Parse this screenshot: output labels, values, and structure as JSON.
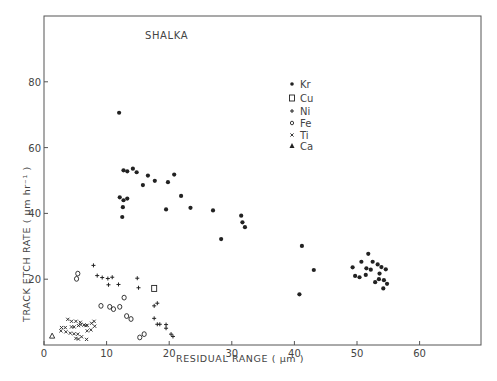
{
  "chart_data": {
    "type": "scatter",
    "title": "SHALKA",
    "xlabel": "RESIDUAL RANGE ( µm )",
    "ylabel": "TRACK ETCH RATE ( µm hr⁻¹ )",
    "xlim": [
      0,
      69.7
    ],
    "ylim": [
      0,
      99
    ],
    "xticks": [
      0,
      10,
      20,
      30,
      40,
      50,
      60
    ],
    "xtick_labels": [
      "0",
      "10",
      "20",
      "30",
      "40",
      "50",
      "60"
    ],
    "yticks": [
      20,
      40,
      60,
      80
    ],
    "ytick_labels": [
      "20",
      "40",
      "60",
      "80"
    ],
    "grid": false,
    "legend_position": "upper-center-right",
    "series": [
      {
        "name": "Kr",
        "marker": "filled-circle",
        "points": [
          [
            12.0,
            70.6
          ],
          [
            12.7,
            53.1
          ],
          [
            13.3,
            52.8
          ],
          [
            14.2,
            53.6
          ],
          [
            14.8,
            52.5
          ],
          [
            16.6,
            51.5
          ],
          [
            15.8,
            48.6
          ],
          [
            17.7,
            49.9
          ],
          [
            19.8,
            49.5
          ],
          [
            20.8,
            51.8
          ],
          [
            12.1,
            44.9
          ],
          [
            12.7,
            44.0
          ],
          [
            13.3,
            44.5
          ],
          [
            12.6,
            41.9
          ],
          [
            12.5,
            38.9
          ],
          [
            21.9,
            45.3
          ],
          [
            19.5,
            41.2
          ],
          [
            23.4,
            41.7
          ],
          [
            27.0,
            40.9
          ],
          [
            31.5,
            39.3
          ],
          [
            31.7,
            37.3
          ],
          [
            32.1,
            35.8
          ],
          [
            28.3,
            32.2
          ],
          [
            41.2,
            30.1
          ],
          [
            43.1,
            22.8
          ],
          [
            40.8,
            15.4
          ],
          [
            49.3,
            23.6
          ],
          [
            50.7,
            25.3
          ],
          [
            51.8,
            27.7
          ],
          [
            52.5,
            25.3
          ],
          [
            53.3,
            24.5
          ],
          [
            53.9,
            23.7
          ],
          [
            54.6,
            23.0
          ],
          [
            51.5,
            23.3
          ],
          [
            52.2,
            22.9
          ],
          [
            49.7,
            21.0
          ],
          [
            50.4,
            20.6
          ],
          [
            51.4,
            21.3
          ],
          [
            53.6,
            21.7
          ],
          [
            53.5,
            20.0
          ],
          [
            54.3,
            19.7
          ],
          [
            52.9,
            19.1
          ],
          [
            54.8,
            18.6
          ],
          [
            54.2,
            17.2
          ]
        ]
      },
      {
        "name": "Cu",
        "marker": "open-square",
        "points": [
          [
            17.6,
            17.2
          ]
        ]
      },
      {
        "name": "Ni",
        "marker": "plus",
        "points": [
          [
            7.9,
            24.2
          ],
          [
            8.5,
            21.1
          ],
          [
            9.3,
            20.5
          ],
          [
            10.2,
            20.2
          ],
          [
            10.9,
            20.6
          ],
          [
            10.3,
            18.3
          ],
          [
            11.9,
            18.4
          ],
          [
            14.9,
            20.3
          ],
          [
            15.1,
            17.4
          ],
          [
            17.6,
            11.9
          ],
          [
            18.1,
            12.7
          ],
          [
            17.6,
            8.1
          ],
          [
            18.1,
            6.3
          ],
          [
            18.5,
            6.3
          ],
          [
            19.5,
            6.2
          ],
          [
            19.5,
            5.1
          ],
          [
            20.3,
            3.3
          ],
          [
            20.6,
            2.6
          ]
        ]
      },
      {
        "name": "Fe",
        "marker": "open-circle",
        "points": [
          [
            5.4,
            21.7
          ],
          [
            5.2,
            20.1
          ],
          [
            9.1,
            11.9
          ],
          [
            10.5,
            11.6
          ],
          [
            11.1,
            10.9
          ],
          [
            12.1,
            11.6
          ],
          [
            12.8,
            14.4
          ],
          [
            13.2,
            8.8
          ],
          [
            13.9,
            7.9
          ],
          [
            15.3,
            2.3
          ],
          [
            16.0,
            3.3
          ]
        ]
      },
      {
        "name": "Ti",
        "marker": "cross",
        "points": [
          [
            3.8,
            7.8
          ],
          [
            4.4,
            7.2
          ],
          [
            5.1,
            7.2
          ],
          [
            5.8,
            6.9
          ],
          [
            6.4,
            6.1
          ],
          [
            6.9,
            6.0
          ],
          [
            7.6,
            6.6
          ],
          [
            8.0,
            7.2
          ],
          [
            8.1,
            5.7
          ],
          [
            2.8,
            5.3
          ],
          [
            3.4,
            5.3
          ],
          [
            4.4,
            5.5
          ],
          [
            4.8,
            5.5
          ],
          [
            5.5,
            5.9
          ],
          [
            5.9,
            6.2
          ],
          [
            6.7,
            5.9
          ],
          [
            2.7,
            4.3
          ],
          [
            3.5,
            4.0
          ],
          [
            4.2,
            3.6
          ],
          [
            4.8,
            3.4
          ],
          [
            5.4,
            3.3
          ],
          [
            6.0,
            2.5
          ],
          [
            5.1,
            2.0
          ],
          [
            5.5,
            1.8
          ],
          [
            6.9,
            4.3
          ],
          [
            7.5,
            4.6
          ],
          [
            6.8,
            1.7
          ]
        ]
      },
      {
        "name": "Ca",
        "marker": "triangle",
        "points": [
          [
            1.3,
            2.7
          ]
        ]
      }
    ]
  },
  "colors": {
    "ink": "#222222",
    "frame": "#555555",
    "text": "#444444",
    "background": "#ffffff"
  }
}
